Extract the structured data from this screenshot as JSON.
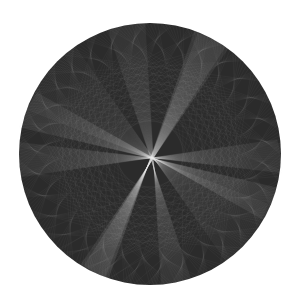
{
  "image": {
    "description": "String-art circle with radiating line bundles",
    "background": "#ffffff",
    "disc": {
      "cx": 150,
      "cy": 154,
      "r": 131,
      "fill": "#2b2b2b"
    },
    "line_color": "#e8e8e8",
    "focal_point": {
      "x": 152,
      "y": 158
    },
    "bundles": [
      {
        "name": "beam-upper-left",
        "from_deg": 200,
        "to_deg": 235,
        "count": 60,
        "opacity": 0.1
      },
      {
        "name": "beam-top-right",
        "from_deg": 290,
        "to_deg": 305,
        "count": 45,
        "opacity": 0.12
      },
      {
        "name": "beam-right",
        "from_deg": 15,
        "to_deg": 30,
        "count": 50,
        "opacity": 0.12
      },
      {
        "name": "beam-bottom-left",
        "from_deg": 110,
        "to_deg": 122,
        "count": 40,
        "opacity": 0.12
      },
      {
        "name": "beam-bottom",
        "from_deg": 72,
        "to_deg": 85,
        "count": 40,
        "opacity": 0.1
      },
      {
        "name": "beam-left",
        "from_deg": 170,
        "to_deg": 185,
        "count": 45,
        "opacity": 0.1
      }
    ],
    "chords": {
      "count": 220,
      "step": 97,
      "opacity": 0.07
    }
  }
}
